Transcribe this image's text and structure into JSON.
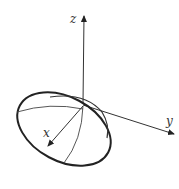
{
  "diagram": {
    "type": "3d-axes-ellipsoid-cap",
    "axes": {
      "x": {
        "label": "x"
      },
      "y": {
        "label": "y"
      },
      "z": {
        "label": "z"
      }
    },
    "colors": {
      "stroke": "#222222",
      "background": "#ffffff"
    }
  }
}
